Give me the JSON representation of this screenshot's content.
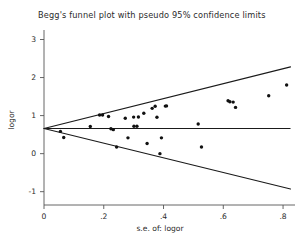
{
  "chart_data": {
    "type": "scatter",
    "title": "Begg's funnel plot with pseudo 95% confidence limits",
    "xlabel": "s.e. of: logor",
    "ylabel": "logor",
    "xlim": [
      0,
      0.84
    ],
    "ylim": [
      -1.35,
      3.25
    ],
    "xticks": [
      0,
      0.2,
      0.4,
      0.6,
      0.8
    ],
    "xticklabels": [
      "0",
      ".2",
      ".4",
      ".6",
      ".8"
    ],
    "yticks": [
      -1,
      0,
      1,
      2,
      3
    ],
    "yticklabels": [
      "-1",
      "0",
      "1",
      "2",
      "3"
    ],
    "grid": false,
    "legend": null,
    "pooled_effect": 0.66,
    "reference_line": {
      "label": "pooled logor",
      "y": 0.66
    },
    "pseudo_95_limits": {
      "upper": {
        "from": [
          0,
          0.66
        ],
        "to": [
          0.825,
          2.28
        ]
      },
      "lower": {
        "from": [
          0,
          0.66
        ],
        "to": [
          0.825,
          -0.93
        ]
      }
    },
    "points": [
      {
        "x": 0.055,
        "y": 0.585
      },
      {
        "x": 0.066,
        "y": 0.425
      },
      {
        "x": 0.155,
        "y": 0.715
      },
      {
        "x": 0.186,
        "y": 1.015
      },
      {
        "x": 0.196,
        "y": 1.015
      },
      {
        "x": 0.216,
        "y": 0.975
      },
      {
        "x": 0.224,
        "y": 0.655
      },
      {
        "x": 0.232,
        "y": 0.63
      },
      {
        "x": 0.243,
        "y": 0.175
      },
      {
        "x": 0.272,
        "y": 0.93
      },
      {
        "x": 0.281,
        "y": 0.415
      },
      {
        "x": 0.3,
        "y": 0.96
      },
      {
        "x": 0.301,
        "y": 0.72
      },
      {
        "x": 0.311,
        "y": 0.72
      },
      {
        "x": 0.316,
        "y": 0.965
      },
      {
        "x": 0.334,
        "y": 1.06
      },
      {
        "x": 0.345,
        "y": 0.265
      },
      {
        "x": 0.362,
        "y": 1.19
      },
      {
        "x": 0.372,
        "y": 1.245
      },
      {
        "x": 0.378,
        "y": 0.955
      },
      {
        "x": 0.388,
        "y": 0.0
      },
      {
        "x": 0.393,
        "y": 0.415
      },
      {
        "x": 0.406,
        "y": 1.25
      },
      {
        "x": 0.41,
        "y": 1.255
      },
      {
        "x": 0.516,
        "y": 0.78
      },
      {
        "x": 0.527,
        "y": 0.175
      },
      {
        "x": 0.616,
        "y": 1.39
      },
      {
        "x": 0.622,
        "y": 1.365
      },
      {
        "x": 0.633,
        "y": 1.355
      },
      {
        "x": 0.641,
        "y": 1.215
      },
      {
        "x": 0.752,
        "y": 1.52
      },
      {
        "x": 0.812,
        "y": 1.805
      }
    ]
  },
  "window": {
    "background": "#ffffff",
    "ink_color": "#1a1a1a",
    "axis_color": "#555555"
  }
}
